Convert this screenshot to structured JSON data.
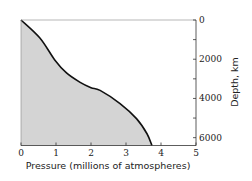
{
  "chart_data": {
    "type": "area",
    "title": "",
    "xlabel": "Pressure (millions of atmospheres)",
    "ylabel": "Depth, km",
    "xlim": [
      0,
      5
    ],
    "ylim": [
      0,
      6400
    ],
    "y_inverted": true,
    "y_axis_position": "right",
    "grid": false,
    "legend": null,
    "x_ticks": [
      0,
      1,
      2,
      3,
      4,
      5
    ],
    "x_tick_labels": [
      "0",
      "1",
      "2",
      "3",
      "4",
      "5"
    ],
    "y_ticks": [
      0,
      1000,
      2000,
      3000,
      4000,
      5000,
      6000
    ],
    "y_tick_labels": [
      "0",
      "",
      "2000",
      "",
      "4000",
      "",
      "6000"
    ],
    "series": [
      {
        "name": "Pressure vs depth",
        "x": [
          0,
          0.54,
          0.97,
          1.3,
          1.69,
          2.0,
          2.26,
          2.83,
          3.3,
          3.6,
          3.74
        ],
        "y": [
          0,
          920,
          2050,
          2700,
          3180,
          3450,
          3590,
          4260,
          5030,
          5800,
          6400
        ],
        "fill": "#d4d4d4",
        "line_color": "#111111"
      }
    ]
  },
  "colors": {
    "background": "#ffffff",
    "fill": "#d4d4d4",
    "line": "#111111",
    "axis": "#333333"
  }
}
